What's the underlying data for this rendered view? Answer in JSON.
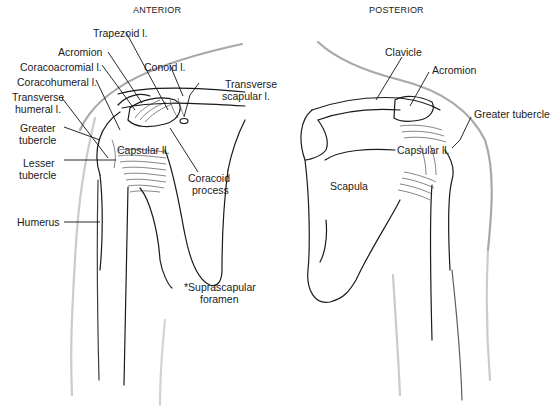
{
  "panels": {
    "anterior": {
      "title": "ANTERIOR",
      "labels": {
        "trapezoid": "Trapezoid l.",
        "acromion": "Acromion",
        "coracoacromial": "Coracoacromial l.",
        "conoid": "Conoid l.",
        "coracohumeral": "Coracohumeral l.",
        "transverse_scapular_1": "Transverse",
        "transverse_scapular_2": "scapular l.",
        "transverse_humeral_1": "Transverse",
        "transverse_humeral_2": "humeral l.",
        "greater_tubercle_1": "Greater",
        "greater_tubercle_2": "tubercle",
        "capsular": "Capsular ll.",
        "lesser_tubercle_1": "Lesser",
        "lesser_tubercle_2": "tubercle",
        "coracoid_1": "Coracoid",
        "coracoid_2": "process",
        "humerus": "Humerus",
        "suprascapular_1": "*Suprascapular",
        "suprascapular_2": "foramen"
      }
    },
    "posterior": {
      "title": "POSTERIOR",
      "labels": {
        "clavicle": "Clavicle",
        "acromion": "Acromion",
        "greater_tubercle": "Greater tubercle",
        "capsular": "Capsular ll.",
        "scapula": "Scapula"
      }
    }
  },
  "colors": {
    "line": "#1a1a1a",
    "outline": "#9a9a9a",
    "background": "#ffffff"
  }
}
